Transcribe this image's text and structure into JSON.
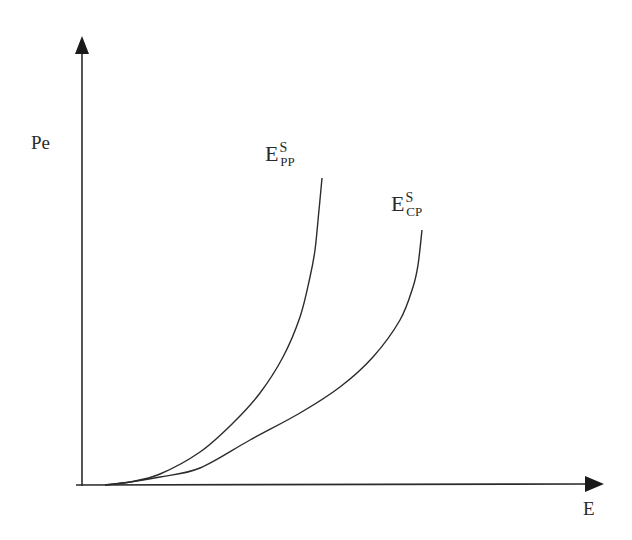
{
  "chart_data": {
    "type": "line",
    "title": "",
    "xlabel": "E",
    "ylabel": "Pe",
    "grid": false,
    "legend": "inline curve labels",
    "axes": {
      "x_tick_labels": [],
      "y_tick_labels": [],
      "arrows": true
    },
    "series": [
      {
        "name": "E^S_PP",
        "label_base": "E",
        "label_sup": "S",
        "label_sub": "PP",
        "description": "steeper convex curve rising from near origin",
        "pixel_points": [
          [
            105,
            485
          ],
          [
            130,
            482
          ],
          [
            160,
            474
          ],
          [
            200,
            452
          ],
          [
            233,
            423
          ],
          [
            260,
            393
          ],
          [
            283,
            357
          ],
          [
            300,
            317
          ],
          [
            310,
            277
          ],
          [
            315,
            250
          ],
          [
            319,
            210
          ],
          [
            322,
            178
          ]
        ]
      },
      {
        "name": "E^S_CP",
        "label_base": "E",
        "label_sup": "S",
        "label_sub": "CP",
        "description": "flatter convex curve rising from near origin, to the right of E^S_PP",
        "pixel_points": [
          [
            105,
            485
          ],
          [
            130,
            482
          ],
          [
            160,
            477
          ],
          [
            200,
            468
          ],
          [
            250,
            440
          ],
          [
            300,
            413
          ],
          [
            340,
            387
          ],
          [
            373,
            357
          ],
          [
            400,
            320
          ],
          [
            413,
            287
          ],
          [
            418,
            265
          ],
          [
            422,
            230
          ]
        ]
      }
    ]
  },
  "labels": {
    "y_axis": "Pe",
    "x_axis": "E",
    "pp": {
      "base": "E",
      "sup": "S",
      "sub": "PP"
    },
    "cp": {
      "base": "E",
      "sup": "S",
      "sub": "CP"
    }
  },
  "style": {
    "stroke": "#2b2b2b",
    "background": "#ffffff"
  }
}
